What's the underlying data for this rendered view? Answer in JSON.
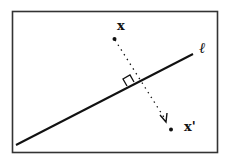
{
  "diagram": {
    "labels": {
      "point": "x",
      "reflected_point": "x'",
      "line": "ℓ"
    },
    "elements": {
      "line": "line ℓ",
      "perpendicular": "dotted arrow from x to x'",
      "right_angle_marker": "square at intersection"
    },
    "colors": {
      "ink": "#111111",
      "frame": "#333333",
      "background": "#ffffff"
    }
  }
}
